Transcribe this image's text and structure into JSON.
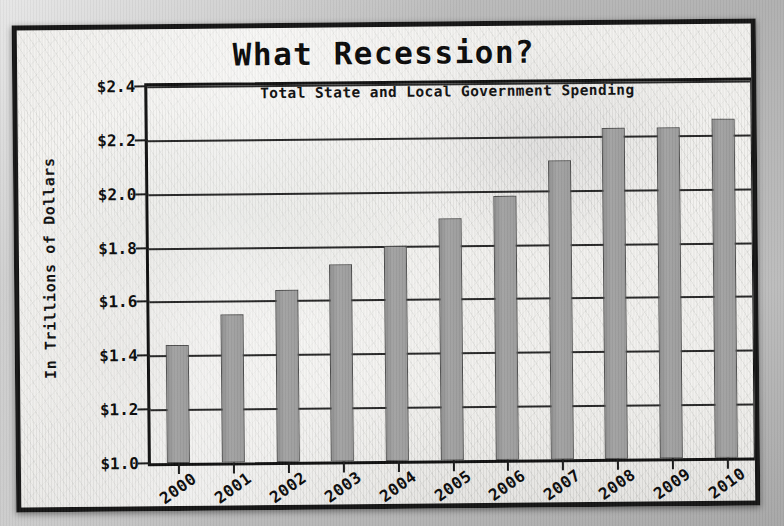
{
  "chart_data": {
    "type": "bar",
    "title": "What Recession?",
    "subtitle": "Total State and Local Government Spending",
    "xlabel": "",
    "ylabel": "In Trillions of Dollars",
    "categories": [
      "2000",
      "2001",
      "2002",
      "2003",
      "2004",
      "2005",
      "2006",
      "2007",
      "2008",
      "2009",
      "2010"
    ],
    "values": [
      1.44,
      1.55,
      1.64,
      1.73,
      1.8,
      1.9,
      1.98,
      2.11,
      2.23,
      2.23,
      2.26
    ],
    "ylim": [
      1.0,
      2.4
    ],
    "ytick_values": [
      1.0,
      1.2,
      1.4,
      1.6,
      1.8,
      2.0,
      2.2,
      2.4
    ],
    "ytick_labels": [
      "$1.0",
      "$1.2",
      "$1.4",
      "$1.6",
      "$1.8",
      "$2.0",
      "$2.2",
      "$2.4"
    ],
    "grid": true,
    "legend": false,
    "legend_position": "none",
    "series": [
      {
        "name": "Total State and Local Government Spending",
        "values": [
          1.44,
          1.55,
          1.64,
          1.73,
          1.8,
          1.9,
          1.98,
          2.11,
          2.23,
          2.23,
          2.26
        ]
      }
    ],
    "colors": {
      "bar_fill": "#9b9b9b",
      "bar_edge": "#4e4e4e",
      "grid": "#262626",
      "frame": "#101010",
      "text": "#0b0b0b",
      "paper": "#f2f1ee",
      "backdrop": "#b4b4b4"
    }
  }
}
